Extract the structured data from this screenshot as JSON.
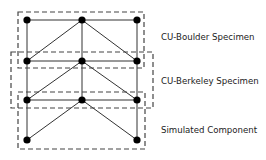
{
  "diagram": {
    "type": "truss-schematic",
    "nodes": [
      {
        "id": "n1",
        "x": 27,
        "y": 20
      },
      {
        "id": "n2",
        "x": 82,
        "y": 20
      },
      {
        "id": "n3",
        "x": 137,
        "y": 20
      },
      {
        "id": "n4",
        "x": 27,
        "y": 61
      },
      {
        "id": "n5",
        "x": 82,
        "y": 61
      },
      {
        "id": "n6",
        "x": 137,
        "y": 61
      },
      {
        "id": "n7",
        "x": 27,
        "y": 100
      },
      {
        "id": "n8",
        "x": 82,
        "y": 100
      },
      {
        "id": "n9",
        "x": 137,
        "y": 100
      },
      {
        "id": "n10",
        "x": 27,
        "y": 140
      },
      {
        "id": "n11",
        "x": 137,
        "y": 140
      }
    ],
    "members": [
      [
        "n1",
        "n2"
      ],
      [
        "n2",
        "n3"
      ],
      [
        "n1",
        "n4"
      ],
      [
        "n2",
        "n5"
      ],
      [
        "n3",
        "n6"
      ],
      [
        "n2",
        "n4"
      ],
      [
        "n2",
        "n6"
      ],
      [
        "n4",
        "n5"
      ],
      [
        "n5",
        "n6"
      ],
      [
        "n4",
        "n7"
      ],
      [
        "n5",
        "n8"
      ],
      [
        "n6",
        "n9"
      ],
      [
        "n5",
        "n7"
      ],
      [
        "n5",
        "n9"
      ],
      [
        "n7",
        "n8"
      ],
      [
        "n8",
        "n9"
      ],
      [
        "n7",
        "n10"
      ],
      [
        "n9",
        "n11"
      ],
      [
        "n8",
        "n10"
      ],
      [
        "n8",
        "n11"
      ]
    ],
    "regions": [
      {
        "name": "CU-Boulder Specimen",
        "x": 18,
        "y": 12,
        "w": 126,
        "h": 56,
        "label_x": 161,
        "label_y": 33
      },
      {
        "name": "CU-Berkeley Specimen",
        "x": 11,
        "y": 52,
        "w": 142,
        "h": 56,
        "label_x": 161,
        "label_y": 77
      },
      {
        "name": "Simulated Component",
        "x": 18,
        "y": 92,
        "w": 127,
        "h": 57,
        "label_x": 161,
        "label_y": 126
      }
    ],
    "colors": {
      "line": "#333333",
      "node": "#000000",
      "dash": "#444444"
    }
  }
}
